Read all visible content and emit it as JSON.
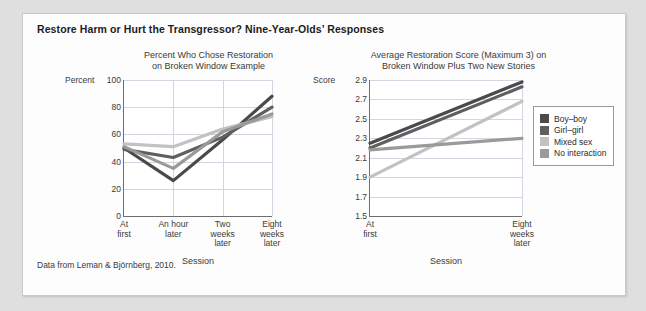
{
  "figure": {
    "title": "Restore Harm or Hurt the Transgressor? Nine-Year-Olds’ Responses",
    "source": "Data from Leman & Björnberg, 2010."
  },
  "legend": {
    "position": "right",
    "items": [
      {
        "label": "Boy–boy",
        "color": "#4a4a4a"
      },
      {
        "label": "Girl–girl",
        "color": "#5f5f5f"
      },
      {
        "label": "Mixed sex",
        "color": "#c2c2c2"
      },
      {
        "label": "No interaction",
        "color": "#9a9a9a"
      }
    ]
  },
  "chart_data": [
    {
      "type": "line",
      "id": "left",
      "title": "Percent Who Chose Restoration on Broken Window Example",
      "title_line1": "Percent Who Chose Restoration",
      "title_line2": "on Broken Window Example",
      "xlabel": "Session",
      "ylabel": "Percent",
      "ylim": [
        0,
        100
      ],
      "yticks": [
        0,
        20,
        40,
        60,
        80,
        100
      ],
      "grid": true,
      "categories": [
        "At first",
        "An hour later",
        "Two weeks later",
        "Eight weeks later"
      ],
      "category_lines": [
        [
          "At",
          "first"
        ],
        [
          "An hour",
          "later"
        ],
        [
          "Two",
          "weeks",
          "later"
        ],
        [
          "Eight",
          "weeks",
          "later"
        ]
      ],
      "series": [
        {
          "name": "Boy–boy",
          "color": "#4a4a4a",
          "values": [
            50,
            26,
            56,
            88
          ]
        },
        {
          "name": "Girl–girl",
          "color": "#5f5f5f",
          "values": [
            49,
            43,
            58,
            80
          ]
        },
        {
          "name": "Mixed sex",
          "color": "#c2c2c2",
          "values": [
            53,
            51,
            64,
            73
          ]
        },
        {
          "name": "No interaction",
          "color": "#9a9a9a",
          "values": [
            51,
            35,
            62,
            75
          ]
        }
      ]
    },
    {
      "type": "line",
      "id": "right",
      "title": "Average Restoration Score (Maximum 3) on Broken Window Plus Two New Stories",
      "title_line1": "Average Restoration Score (Maximum 3) on",
      "title_line2": "Broken Window Plus Two New Stories",
      "xlabel": "Session",
      "ylabel": "Score",
      "ylim": [
        1.5,
        2.9
      ],
      "yticks": [
        1.5,
        1.7,
        1.9,
        2.1,
        2.3,
        2.5,
        2.7,
        2.9
      ],
      "grid": true,
      "categories": [
        "At first",
        "Eight weeks later"
      ],
      "category_lines": [
        [
          "At",
          "first"
        ],
        [
          "Eight",
          "weeks",
          "later"
        ]
      ],
      "series": [
        {
          "name": "Boy–boy",
          "color": "#4a4a4a",
          "values": [
            2.25,
            2.88
          ]
        },
        {
          "name": "Girl–girl",
          "color": "#5f5f5f",
          "values": [
            2.2,
            2.83
          ]
        },
        {
          "name": "Mixed sex",
          "color": "#c2c2c2",
          "values": [
            1.9,
            2.68
          ]
        },
        {
          "name": "No interaction",
          "color": "#9a9a9a",
          "values": [
            2.18,
            2.3
          ]
        }
      ]
    }
  ]
}
